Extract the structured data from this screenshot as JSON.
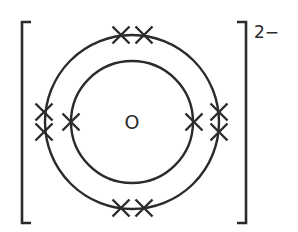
{
  "diagram": {
    "nucleus_label": "O",
    "charge_label": "2−",
    "colors": {
      "stroke": "#2b2b2b",
      "background": "#ffffff"
    },
    "center": {
      "x": 132,
      "y": 122
    },
    "shells": [
      {
        "name": "inner-shell",
        "radius": 61,
        "electrons": 2
      },
      {
        "name": "outer-shell",
        "radius": 87,
        "electrons": 8
      }
    ],
    "electron_symbol": "cross",
    "electrons": [
      {
        "shell": "inner-shell",
        "x": 71,
        "y": 122
      },
      {
        "shell": "inner-shell",
        "x": 194,
        "y": 122
      },
      {
        "shell": "outer-shell",
        "x": 121,
        "y": 35
      },
      {
        "shell": "outer-shell",
        "x": 144,
        "y": 35
      },
      {
        "shell": "outer-shell",
        "x": 121,
        "y": 208
      },
      {
        "shell": "outer-shell",
        "x": 144,
        "y": 208
      },
      {
        "shell": "outer-shell",
        "x": 44,
        "y": 112
      },
      {
        "shell": "outer-shell",
        "x": 44,
        "y": 132
      },
      {
        "shell": "outer-shell",
        "x": 219,
        "y": 112
      },
      {
        "shell": "outer-shell",
        "x": 219,
        "y": 132
      }
    ]
  }
}
